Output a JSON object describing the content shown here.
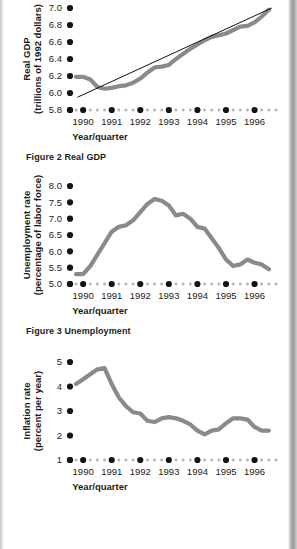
{
  "page": {
    "background": "#ffffff",
    "ink": "#1b1b1b",
    "line_color": "#8a8a8a",
    "trend_color": "#111111",
    "tick_major_color": "#141414",
    "tick_minor_color": "#b5b5b5"
  },
  "figures": [
    {
      "id": "figure-2",
      "caption": "Figure 2 Real GDP",
      "chart_data": {
        "type": "line",
        "title": "",
        "xlabel": "Year/quarter",
        "ylabel": "Real GDP\n(trillions of 1992 dollars)",
        "ylabel_line1": "Real GDP",
        "ylabel_line2": "(trillions of 1992 dollars)",
        "yticks": [
          "7.0",
          "6.8",
          "6.6",
          "6.4",
          "6.2",
          "6.0",
          "5.8"
        ],
        "ylim": [
          5.8,
          7.0
        ],
        "xticks": [
          "1990",
          "1991",
          "1992",
          "1993",
          "1994",
          "1995",
          "1996"
        ],
        "xlim": [
          1989.75,
          1996.75
        ],
        "grid": false,
        "legend": "none",
        "series": [
          {
            "name": "Real GDP",
            "style": "thick-gray",
            "x": [
              1989.75,
              1990.0,
              1990.25,
              1990.5,
              1990.75,
              1991.0,
              1991.25,
              1991.5,
              1991.75,
              1992.0,
              1992.25,
              1992.5,
              1992.75,
              1993.0,
              1993.25,
              1993.5,
              1993.75,
              1994.0,
              1994.25,
              1994.5,
              1994.75,
              1995.0,
              1995.25,
              1995.5,
              1995.75,
              1996.0,
              1996.25,
              1996.5
            ],
            "values": [
              6.19,
              6.19,
              6.16,
              6.07,
              6.05,
              6.06,
              6.08,
              6.09,
              6.12,
              6.17,
              6.24,
              6.3,
              6.31,
              6.33,
              6.4,
              6.46,
              6.52,
              6.57,
              6.62,
              6.66,
              6.68,
              6.7,
              6.74,
              6.78,
              6.79,
              6.83,
              6.9,
              6.98
            ]
          },
          {
            "name": "Trend",
            "style": "thin-black",
            "x": [
              1989.8,
              1996.6
            ],
            "values": [
              5.95,
              7.0
            ]
          }
        ]
      }
    },
    {
      "id": "figure-3",
      "caption": "Figure 3 Unemployment",
      "chart_data": {
        "type": "line",
        "title": "",
        "xlabel": "Year/quarter",
        "ylabel": "Unemployment rate\n(percentage of labor force)",
        "ylabel_line1": "Unemployment rate",
        "ylabel_line2": "(percentage of labor force)",
        "yticks": [
          "8.0",
          "7.5",
          "7.0",
          "6.5",
          "6.0",
          "5.5",
          "5.0"
        ],
        "ylim": [
          5.0,
          8.0
        ],
        "xticks": [
          "1990",
          "1991",
          "1992",
          "1993",
          "1994",
          "1995",
          "1996"
        ],
        "xlim": [
          1989.75,
          1996.75
        ],
        "grid": false,
        "legend": "none",
        "series": [
          {
            "name": "Unemployment rate",
            "style": "thick-gray",
            "x": [
              1989.75,
              1990.0,
              1990.25,
              1990.5,
              1990.75,
              1991.0,
              1991.25,
              1991.5,
              1991.75,
              1992.0,
              1992.25,
              1992.5,
              1992.75,
              1993.0,
              1993.25,
              1993.5,
              1993.75,
              1994.0,
              1994.25,
              1994.5,
              1994.75,
              1995.0,
              1995.25,
              1995.5,
              1995.75,
              1996.0,
              1996.25,
              1996.5
            ],
            "values": [
              5.3,
              5.3,
              5.55,
              5.9,
              6.25,
              6.6,
              6.75,
              6.8,
              6.95,
              7.2,
              7.45,
              7.6,
              7.55,
              7.4,
              7.1,
              7.15,
              7.0,
              6.75,
              6.7,
              6.4,
              6.1,
              5.75,
              5.55,
              5.6,
              5.75,
              5.65,
              5.6,
              5.45,
              5.35
            ]
          }
        ]
      }
    },
    {
      "id": "figure-4",
      "caption": "",
      "chart_data": {
        "type": "line",
        "title": "",
        "xlabel": "Year/quarter",
        "ylabel": "Inflation rate\n(percent per year)",
        "ylabel_line1": "Inflation rate",
        "ylabel_line2": "(percent per year)",
        "yticks": [
          "5",
          "4",
          "3",
          "2",
          "1"
        ],
        "ylim": [
          1,
          5
        ],
        "xticks": [
          "1990",
          "1991",
          "1992",
          "1993",
          "1994",
          "1995",
          "1996"
        ],
        "xlim": [
          1989.75,
          1996.75
        ],
        "grid": false,
        "legend": "none",
        "series": [
          {
            "name": "Inflation rate",
            "style": "thick-gray",
            "x": [
              1989.75,
              1990.0,
              1990.25,
              1990.5,
              1990.75,
              1991.0,
              1991.25,
              1991.5,
              1991.75,
              1992.0,
              1992.25,
              1992.5,
              1992.75,
              1993.0,
              1993.25,
              1993.5,
              1993.75,
              1994.0,
              1994.25,
              1994.5,
              1994.75,
              1995.0,
              1995.25,
              1995.5,
              1995.75,
              1996.0,
              1996.25,
              1996.5
            ],
            "values": [
              4.1,
              4.3,
              4.5,
              4.7,
              4.75,
              4.1,
              3.55,
              3.2,
              2.95,
              2.9,
              2.6,
              2.55,
              2.7,
              2.75,
              2.7,
              2.6,
              2.45,
              2.2,
              2.05,
              2.2,
              2.25,
              2.5,
              2.7,
              2.7,
              2.65,
              2.35,
              2.2,
              2.2
            ]
          }
        ]
      }
    }
  ]
}
